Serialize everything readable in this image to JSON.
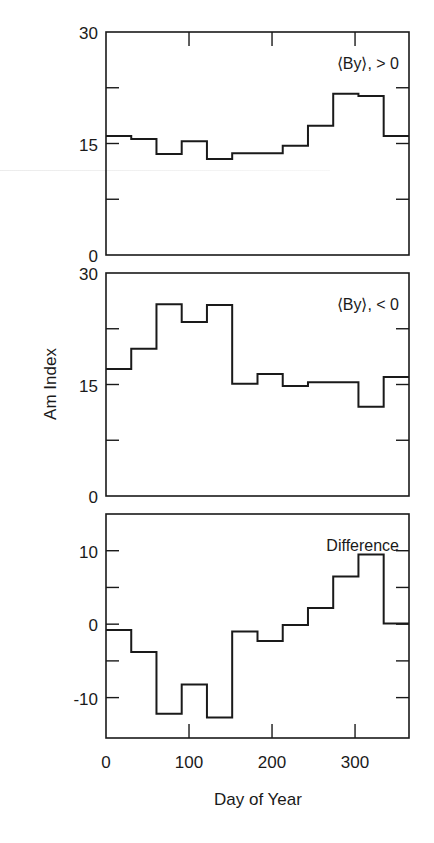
{
  "figure": {
    "ylabel": "Am Index",
    "xlabel": "Day of Year",
    "line_color": "#1a1a1a",
    "background": "#ffffff"
  },
  "chart_data": [
    {
      "type": "line",
      "style": "step",
      "title": "",
      "annotation": "⟨By⟩, > 0",
      "xlabel": "",
      "ylabel": "Am Index",
      "bin_edges": [
        0,
        30.4,
        60.8,
        91.2,
        121.6,
        152,
        182.5,
        212.9,
        243.3,
        273.7,
        304.1,
        334.5,
        365
      ],
      "values": [
        16.0,
        15.6,
        13.6,
        15.3,
        12.9,
        13.7,
        13.7,
        14.7,
        17.4,
        21.7,
        21.4,
        16.0
      ],
      "xlim": [
        0,
        365
      ],
      "ylim": [
        0,
        30
      ],
      "yticks_major": [
        0,
        15,
        30
      ],
      "yticks_minor": [
        7.5,
        22.5
      ],
      "ytick_labels": [
        "0",
        "15",
        "30"
      ],
      "xticks": [
        100,
        200,
        300
      ],
      "grid": false
    },
    {
      "type": "line",
      "style": "step",
      "title": "",
      "annotation": "⟨By⟩, < 0",
      "xlabel": "",
      "ylabel": "Am Index",
      "bin_edges": [
        0,
        30.4,
        60.8,
        91.2,
        121.6,
        152,
        182.5,
        212.9,
        243.3,
        273.7,
        304.1,
        334.5,
        365
      ],
      "values": [
        17.1,
        19.8,
        25.8,
        23.4,
        25.7,
        15.1,
        16.4,
        14.8,
        15.3,
        15.3,
        12.0,
        16.0
      ],
      "xlim": [
        0,
        365
      ],
      "ylim": [
        0,
        30
      ],
      "yticks_major": [
        0,
        15,
        30
      ],
      "yticks_minor": [
        7.5,
        22.5
      ],
      "ytick_labels": [
        "0",
        "15",
        "30"
      ],
      "xticks": [],
      "grid": false
    },
    {
      "type": "line",
      "style": "step",
      "title": "",
      "annotation": "Difference",
      "xlabel": "Day of Year",
      "ylabel": "",
      "bin_edges": [
        0,
        30.4,
        60.8,
        91.2,
        121.6,
        152,
        182.5,
        212.9,
        243.3,
        273.7,
        304.1,
        334.5,
        365
      ],
      "values": [
        -0.8,
        -3.8,
        -12.2,
        -8.2,
        -12.7,
        -1.0,
        -2.3,
        -0.1,
        2.2,
        6.5,
        9.5,
        0.1
      ],
      "xlim": [
        0,
        365
      ],
      "ylim": [
        -15.5,
        15
      ],
      "yticks_major": [
        -10,
        0,
        10
      ],
      "yticks_minor": [
        -5,
        5
      ],
      "ytick_labels": [
        "-10",
        "0",
        "10"
      ],
      "xticks": [
        0,
        100,
        200,
        300
      ],
      "xtick_labels": [
        "0",
        "100",
        "200",
        "300"
      ],
      "grid": false
    }
  ]
}
